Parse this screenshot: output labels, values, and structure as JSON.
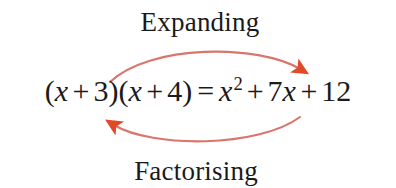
{
  "diagram": {
    "background_color": "#ffffff",
    "text_color": "#1a1a1a",
    "top_label": "Expanding",
    "bottom_label": "Factorising",
    "equation": {
      "full_text": "(x + 3)(x + 4) = x² + 7x + 12",
      "left_side": "(x + 3)(x + 4)",
      "relation": "=",
      "right_side": "x² + 7x + 12",
      "tokens": {
        "open_paren_1": "(",
        "var_x_1": "x",
        "plus_1": "+",
        "num_3": "3",
        "close_paren_1": ")",
        "open_paren_2": "(",
        "var_x_2": "x",
        "plus_2": "+",
        "num_4": "4",
        "close_paren_2": ")",
        "equals": "=",
        "var_x_3": "x",
        "exponent_2": "2",
        "plus_3": "+",
        "coeff_7": "7",
        "var_x_4": "x",
        "plus_4": "+",
        "num_12": "12"
      }
    },
    "arrows": {
      "stroke_color": "#d9756b",
      "arrowhead_color": "#e04a28",
      "top": {
        "name": "expanding-arrow",
        "direction": "left-to-right",
        "label": "Expanding"
      },
      "bottom": {
        "name": "factorising-arrow",
        "direction": "right-to-left",
        "label": "Factorising"
      }
    }
  }
}
